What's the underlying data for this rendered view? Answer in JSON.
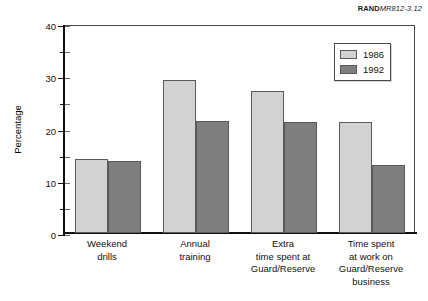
{
  "source_credit": {
    "prefix": "RAND",
    "code": "MR812-3.12"
  },
  "chart_data": {
    "type": "bar",
    "title": "",
    "xlabel": "",
    "ylabel": "Percentage",
    "ylim": [
      0,
      40
    ],
    "ytick_values": [
      0,
      10,
      20,
      30,
      40
    ],
    "ytick_labels": [
      "0",
      "10",
      "20",
      "30",
      "40"
    ],
    "yminor_values": [
      5,
      15,
      25,
      35
    ],
    "grid": false,
    "legend_position": "top-right",
    "categories": [
      "Weekend\ndrills",
      "Annual\ntraining",
      "Extra\ntime spent at\nGuard/Reserve",
      "Time spent\nat work on\nGuard/Reserve\nbusiness"
    ],
    "series": [
      {
        "name": "1986",
        "color": "#d2d2d2",
        "values": [
          14.2,
          29.2,
          27.2,
          21.3
        ]
      },
      {
        "name": "1992",
        "color": "#7e7e7e",
        "values": [
          13.8,
          21.5,
          21.3,
          13.1
        ]
      }
    ]
  }
}
